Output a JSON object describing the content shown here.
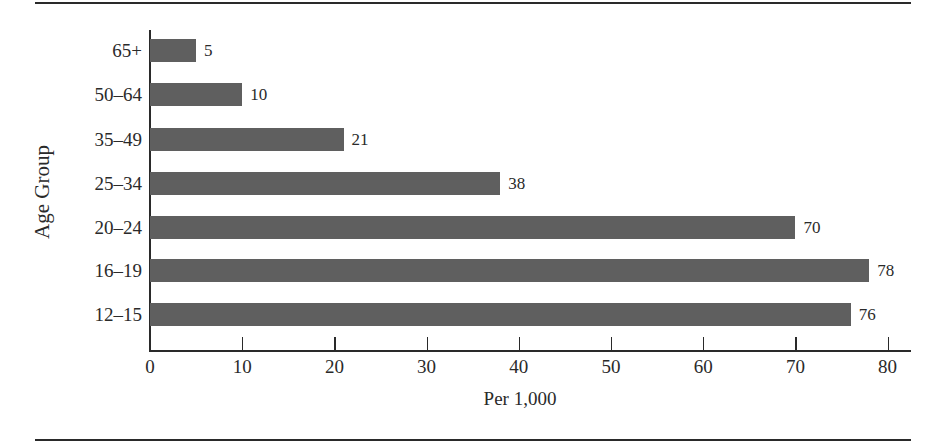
{
  "chart_data": {
    "type": "bar",
    "orientation": "horizontal",
    "title": "",
    "xlabel": "Per 1,000",
    "ylabel": "Age Group",
    "categories": [
      "65+",
      "50–64",
      "35–49",
      "25–34",
      "20–24",
      "16–19",
      "12–15"
    ],
    "values": [
      5,
      10,
      21,
      38,
      70,
      78,
      76
    ],
    "data_labels": [
      "5",
      "10",
      "21",
      "38",
      "70",
      "78",
      "76"
    ],
    "xlim": [
      0,
      80
    ],
    "x_ticks": [
      "0",
      "10",
      "20",
      "30",
      "40",
      "50",
      "60",
      "70",
      "80"
    ],
    "grid": false,
    "legend": null,
    "bar_color": "#5f5f5f"
  }
}
